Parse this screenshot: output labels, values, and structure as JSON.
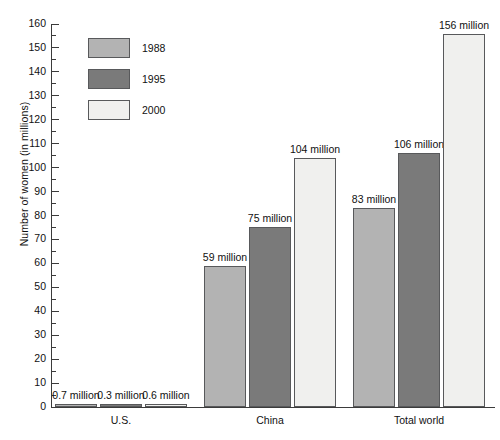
{
  "chart_data": {
    "type": "bar",
    "title": "",
    "xlabel": "",
    "ylabel": "Number of women (in millions)",
    "ylim": [
      0,
      160
    ],
    "ytick_step": 10,
    "yminor_step": 5,
    "grid": false,
    "legend_position": "upper-left-inside",
    "categories": [
      "U.S.",
      "China",
      "Total world"
    ],
    "series": [
      {
        "name": "1988",
        "color": "#b3b3b3",
        "values": [
          0.7,
          59,
          83
        ],
        "labels": [
          "0.7 million",
          "59 million",
          "83 million"
        ]
      },
      {
        "name": "1995",
        "color": "#7a7a7a",
        "values": [
          0.3,
          75,
          106
        ],
        "labels": [
          "0.3 million",
          "75 million",
          "106 million"
        ]
      },
      {
        "name": "2000",
        "color": "#f0f0ee",
        "values": [
          0.6,
          104,
          156
        ],
        "labels": [
          "0.6 million",
          "104 million",
          "156 million"
        ]
      }
    ],
    "ytick_labels": [
      "0",
      "10",
      "20",
      "30",
      "40",
      "50",
      "60",
      "70",
      "80",
      "90",
      "100",
      "110",
      "120",
      "130",
      "140",
      "150",
      "160"
    ]
  },
  "legend": {
    "items": [
      {
        "label": "1988"
      },
      {
        "label": "1995"
      },
      {
        "label": "2000"
      }
    ]
  },
  "axis": {
    "y_title": "Number of women (in millions)"
  }
}
